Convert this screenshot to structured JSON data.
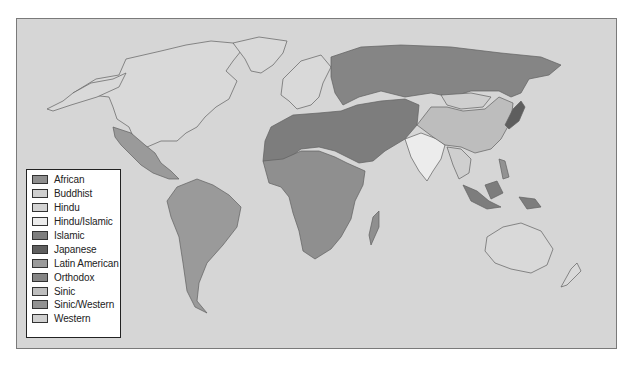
{
  "map": {
    "title": "",
    "background_color": "#d6d6d6",
    "land_default_color": "#d9d9d9",
    "border_color": "#555555"
  },
  "legend": {
    "items": [
      {
        "label": "African",
        "color": "#8f8f8f"
      },
      {
        "label": "Buddhist",
        "color": "#cfcfcf"
      },
      {
        "label": "Hindu",
        "color": "#d2d2d2"
      },
      {
        "label": "Hindu/Islamic",
        "color": "#ececec"
      },
      {
        "label": "Islamic",
        "color": "#7d7d7d"
      },
      {
        "label": "Japanese",
        "color": "#5e5e5e"
      },
      {
        "label": "Latin American",
        "color": "#9a9a9a"
      },
      {
        "label": "Orthodox",
        "color": "#858585"
      },
      {
        "label": "Sinic",
        "color": "#bdbdbd"
      },
      {
        "label": "Sinic/Western",
        "color": "#929292"
      },
      {
        "label": "Western",
        "color": "#d0d0d0"
      }
    ]
  },
  "regions": [
    {
      "name": "North America",
      "civilization": "Western"
    },
    {
      "name": "Greenland",
      "civilization": "Western"
    },
    {
      "name": "Mexico and Central America",
      "civilization": "Latin American"
    },
    {
      "name": "South America",
      "civilization": "Latin American"
    },
    {
      "name": "Western Europe",
      "civilization": "Western"
    },
    {
      "name": "Russia and Eastern Europe",
      "civilization": "Orthodox"
    },
    {
      "name": "North Africa and Middle East",
      "civilization": "Islamic"
    },
    {
      "name": "Central Asia",
      "civilization": "Islamic"
    },
    {
      "name": "Sub-Saharan Africa",
      "civilization": "African"
    },
    {
      "name": "Madagascar",
      "civilization": "African"
    },
    {
      "name": "India",
      "civilization": "Hindu/Islamic"
    },
    {
      "name": "Mongolia",
      "civilization": "Buddhist"
    },
    {
      "name": "China",
      "civilization": "Sinic"
    },
    {
      "name": "Japan",
      "civilization": "Japanese"
    },
    {
      "name": "Southeast Asia",
      "civilization": "Buddhist"
    },
    {
      "name": "Indonesia and Malaysia",
      "civilization": "Islamic"
    },
    {
      "name": "Philippines",
      "civilization": "Sinic/Western"
    },
    {
      "name": "Australia and New Zealand",
      "civilization": "Western"
    }
  ]
}
